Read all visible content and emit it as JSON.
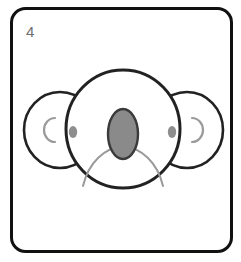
{
  "card": {
    "number_label": "4",
    "background_color": "#ffffff",
    "border_color": "#111111",
    "border_width": 3,
    "corner_radius": 14,
    "number_color": "#6e6e6e"
  },
  "illustration": {
    "name": "koala-face",
    "description": "Line drawing of a koala face: round head, two large round ears with C-shaped inner arcs, two small gray oval eyes, a large dark gray oval nose, and a light gray dome-shaped muzzle arc",
    "colors": {
      "outline": "#222222",
      "nose_fill": "#8a8a8a",
      "nose_stroke": "#3a3a3a",
      "eye_fill": "#8e8e8e",
      "inner_ear_stroke": "#9a9a9a",
      "muzzle_stroke": "#9a9a9a",
      "face_fill": "#ffffff"
    },
    "parts": [
      {
        "name": "left-ear",
        "cx": 60,
        "cy": 130,
        "rx": 36,
        "ry": 38
      },
      {
        "name": "right-ear",
        "cx": 187,
        "cy": 130,
        "rx": 36,
        "ry": 38
      },
      {
        "name": "left-inner-ear",
        "cx": 56,
        "cy": 130,
        "rx": 11,
        "ry": 12
      },
      {
        "name": "right-inner-ear",
        "cx": 191,
        "cy": 130,
        "rx": 11,
        "ry": 12
      },
      {
        "name": "head",
        "cx": 123,
        "cy": 129,
        "rx": 57,
        "ry": 59
      },
      {
        "name": "left-eye",
        "cx": 73,
        "cy": 132,
        "rx": 4.2,
        "ry": 6
      },
      {
        "name": "right-eye",
        "cx": 172,
        "cy": 132,
        "rx": 4.2,
        "ry": 6
      },
      {
        "name": "nose",
        "cx": 123,
        "cy": 134,
        "rx": 15,
        "ry": 25
      },
      {
        "name": "muzzle-arc",
        "cx": 123,
        "cy": 186,
        "rx": 40,
        "ry": 55
      }
    ]
  }
}
